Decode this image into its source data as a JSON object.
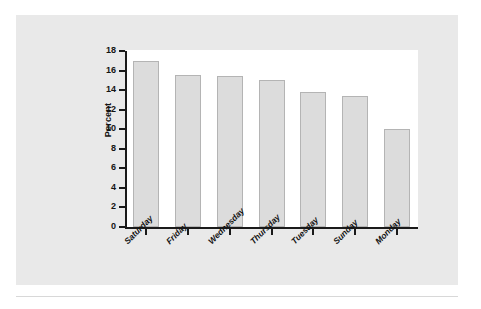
{
  "chart_data": {
    "type": "bar",
    "title": "",
    "subtitle": "",
    "xlabel": "",
    "ylabel": "Percent",
    "categories": [
      "Saturday",
      "Friday",
      "Wednesday",
      "Thursday",
      "Tuesday",
      "Sunday",
      "Monday"
    ],
    "values": [
      17.0,
      15.5,
      15.4,
      15.0,
      13.8,
      13.4,
      10.0
    ],
    "ylim": [
      0,
      18
    ],
    "ytick_labels": [
      "0",
      "2",
      "4",
      "6",
      "8",
      "10",
      "12",
      "14",
      "16",
      "18"
    ],
    "ytick_values": [
      0,
      2,
      4,
      6,
      8,
      10,
      12,
      14,
      16,
      18
    ],
    "grid": false,
    "legend": null,
    "annotations": [],
    "bar_fill_color": "#dcdcdc",
    "bar_border_color": "#b4b4b4",
    "plot_background_color": "#ffffff",
    "figure_background_color": "#e9e9e9",
    "axis_color": "#1a1a1a",
    "xlabel_rotation_degrees": -45
  }
}
